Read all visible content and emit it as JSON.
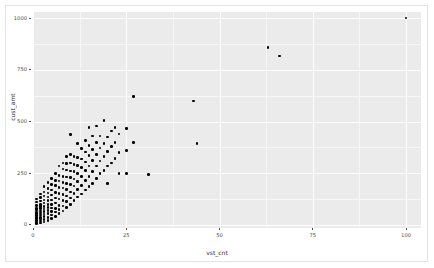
{
  "chart_data": {
    "type": "scatter",
    "title": "",
    "xlabel": "vst_cnt",
    "ylabel": "cust_amt",
    "xlim": [
      0,
      104
    ],
    "ylim": [
      -15,
      1030
    ],
    "xticks": [
      0,
      25,
      50,
      75,
      100
    ],
    "xticklabels": [
      "0",
      "25",
      "50",
      "75",
      "100"
    ],
    "yticks": [
      0,
      250,
      500,
      750,
      1000
    ],
    "yticklabels": [
      "0",
      "250",
      "500",
      "750",
      "1000"
    ],
    "grid": true,
    "grid_color": "#ffffff",
    "panel_background": "#ebebeb",
    "point_color": "#000000",
    "legend": "none",
    "series": [
      {
        "name": "customers",
        "points": [
          [
            1,
            8
          ],
          [
            1,
            15
          ],
          [
            1,
            22
          ],
          [
            1,
            30
          ],
          [
            1,
            38
          ],
          [
            1,
            46
          ],
          [
            1,
            55
          ],
          [
            1,
            63
          ],
          [
            1,
            72
          ],
          [
            1,
            80
          ],
          [
            1,
            95
          ],
          [
            1,
            110
          ],
          [
            1,
            125
          ],
          [
            2,
            10
          ],
          [
            2,
            18
          ],
          [
            2,
            28
          ],
          [
            2,
            36
          ],
          [
            2,
            48
          ],
          [
            2,
            58
          ],
          [
            2,
            68
          ],
          [
            2,
            78
          ],
          [
            2,
            88
          ],
          [
            2,
            100
          ],
          [
            2,
            115
          ],
          [
            2,
            132
          ],
          [
            2,
            150
          ],
          [
            3,
            14
          ],
          [
            3,
            25
          ],
          [
            3,
            40
          ],
          [
            3,
            52
          ],
          [
            3,
            64
          ],
          [
            3,
            76
          ],
          [
            3,
            90
          ],
          [
            3,
            105
          ],
          [
            3,
            120
          ],
          [
            3,
            140
          ],
          [
            3,
            160
          ],
          [
            3,
            185
          ],
          [
            4,
            20
          ],
          [
            4,
            35
          ],
          [
            4,
            55
          ],
          [
            4,
            70
          ],
          [
            4,
            85
          ],
          [
            4,
            100
          ],
          [
            4,
            118
          ],
          [
            4,
            135
          ],
          [
            4,
            155
          ],
          [
            4,
            175
          ],
          [
            4,
            205
          ],
          [
            5,
            30
          ],
          [
            5,
            48
          ],
          [
            5,
            66
          ],
          [
            5,
            82
          ],
          [
            5,
            98
          ],
          [
            5,
            120
          ],
          [
            5,
            145
          ],
          [
            5,
            168
          ],
          [
            5,
            195
          ],
          [
            5,
            225
          ],
          [
            6,
            42
          ],
          [
            6,
            62
          ],
          [
            6,
            80
          ],
          [
            6,
            105
          ],
          [
            6,
            130
          ],
          [
            6,
            158
          ],
          [
            6,
            190
          ],
          [
            6,
            215
          ],
          [
            6,
            248
          ],
          [
            7,
            55
          ],
          [
            7,
            75
          ],
          [
            7,
            95
          ],
          [
            7,
            125
          ],
          [
            7,
            152
          ],
          [
            7,
            180
          ],
          [
            7,
            212
          ],
          [
            7,
            240
          ],
          [
            7,
            285
          ],
          [
            8,
            68
          ],
          [
            8,
            92
          ],
          [
            8,
            118
          ],
          [
            8,
            148
          ],
          [
            8,
            178
          ],
          [
            8,
            205
          ],
          [
            8,
            235
          ],
          [
            8,
            270
          ],
          [
            8,
            300
          ],
          [
            9,
            85
          ],
          [
            9,
            112
          ],
          [
            9,
            140
          ],
          [
            9,
            170
          ],
          [
            9,
            200
          ],
          [
            9,
            232
          ],
          [
            9,
            265
          ],
          [
            9,
            298
          ],
          [
            9,
            330
          ],
          [
            10,
            100
          ],
          [
            10,
            130
          ],
          [
            10,
            160
          ],
          [
            10,
            195
          ],
          [
            10,
            228
          ],
          [
            10,
            260
          ],
          [
            10,
            300
          ],
          [
            10,
            340
          ],
          [
            10,
            438
          ],
          [
            11,
            118
          ],
          [
            11,
            152
          ],
          [
            11,
            188
          ],
          [
            11,
            222
          ],
          [
            11,
            258
          ],
          [
            11,
            292
          ],
          [
            11,
            330
          ],
          [
            12,
            135
          ],
          [
            12,
            172
          ],
          [
            12,
            210
          ],
          [
            12,
            248
          ],
          [
            12,
            288
          ],
          [
            12,
            325
          ],
          [
            12,
            395
          ],
          [
            13,
            150
          ],
          [
            13,
            192
          ],
          [
            13,
            235
          ],
          [
            13,
            278
          ],
          [
            13,
            318
          ],
          [
            13,
            370
          ],
          [
            14,
            168
          ],
          [
            14,
            215
          ],
          [
            14,
            262
          ],
          [
            14,
            305
          ],
          [
            14,
            352
          ],
          [
            14,
            408
          ],
          [
            15,
            185
          ],
          [
            15,
            235
          ],
          [
            15,
            285
          ],
          [
            15,
            335
          ],
          [
            15,
            385
          ],
          [
            15,
            470
          ],
          [
            16,
            200
          ],
          [
            16,
            258
          ],
          [
            16,
            312
          ],
          [
            16,
            365
          ],
          [
            16,
            430
          ],
          [
            17,
            225
          ],
          [
            17,
            285
          ],
          [
            17,
            340
          ],
          [
            17,
            400
          ],
          [
            17,
            478
          ],
          [
            18,
            248
          ],
          [
            18,
            310
          ],
          [
            18,
            372
          ],
          [
            18,
            430
          ],
          [
            19,
            262
          ],
          [
            19,
            330
          ],
          [
            19,
            395
          ],
          [
            19,
            505
          ],
          [
            20,
            200
          ],
          [
            20,
            285
          ],
          [
            20,
            355
          ],
          [
            20,
            425
          ],
          [
            21,
            300
          ],
          [
            21,
            380
          ],
          [
            21,
            455
          ],
          [
            22,
            320
          ],
          [
            22,
            400
          ],
          [
            22,
            470
          ],
          [
            23,
            250
          ],
          [
            23,
            350
          ],
          [
            23,
            440
          ],
          [
            25,
            248
          ],
          [
            25,
            360
          ],
          [
            25,
            465
          ],
          [
            27,
            400
          ],
          [
            27,
            620
          ],
          [
            31,
            245
          ],
          [
            43,
            600
          ],
          [
            44,
            395
          ],
          [
            63,
            858
          ],
          [
            66,
            818
          ],
          [
            100,
            1000
          ]
        ]
      }
    ]
  },
  "axes": {
    "x_title": "vst_cnt",
    "y_title": "cust_amt"
  }
}
